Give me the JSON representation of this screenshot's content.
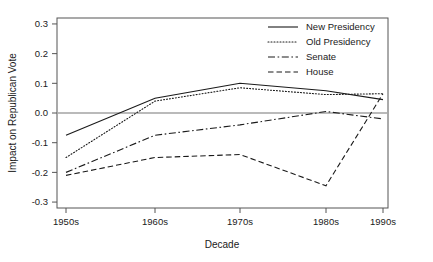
{
  "chart_data": {
    "type": "line",
    "title": "",
    "xlabel": "Decade",
    "ylabel": "Impact on Republican Vote",
    "categories": [
      "1950s",
      "1960s",
      "1970s",
      "1980s",
      "1990s"
    ],
    "x_tick_labels": [
      "1950s",
      "1960s",
      "1970s",
      "1980s",
      "1990s"
    ],
    "y_tick_labels": [
      "0.3",
      "0.2",
      "0.1",
      "0.0",
      "-0.1",
      "-0.2",
      "-0.3"
    ],
    "y_tick_values": [
      0.3,
      0.2,
      0.1,
      0.0,
      -0.1,
      -0.2,
      -0.3
    ],
    "ylim": [
      -0.32,
      0.32
    ],
    "grid": false,
    "zero_reference_line": 0.0,
    "legend_position": "top-right",
    "series": [
      {
        "name": "New Presidency",
        "style": "solid",
        "values": [
          -0.075,
          0.05,
          0.1,
          0.075,
          0.045
        ]
      },
      {
        "name": "Old Presidency",
        "style": "dotted",
        "values": [
          -0.15,
          0.04,
          0.085,
          0.062,
          0.065
        ]
      },
      {
        "name": "Senate",
        "style": "dashdot",
        "values": [
          -0.2,
          -0.075,
          -0.04,
          0.005,
          -0.02
        ]
      },
      {
        "name": "House",
        "style": "dashed",
        "values": [
          -0.21,
          -0.15,
          -0.14,
          -0.245,
          0.065
        ]
      }
    ]
  },
  "colors": {
    "line": "#1a1a1a",
    "frame": "#555555",
    "zero": "#777777",
    "background": "#ffffff"
  }
}
